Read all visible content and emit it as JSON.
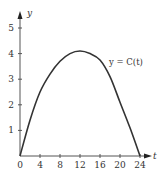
{
  "chart_data": {
    "type": "line",
    "title": "",
    "xlabel": "t",
    "ylabel": "y",
    "xlim": [
      0,
      24
    ],
    "ylim": [
      0,
      5
    ],
    "x_ticks": [
      0,
      4,
      8,
      12,
      16,
      20,
      24
    ],
    "y_ticks": [
      1,
      2,
      3,
      4,
      5
    ],
    "grid": false,
    "legend": "none",
    "annotations": [
      {
        "text": "y = C(t)",
        "x": 18,
        "y": 3.6
      }
    ],
    "series": [
      {
        "name": "y = C(t)",
        "x": [
          0,
          2,
          4,
          6,
          8,
          10,
          12,
          14,
          16,
          18,
          20,
          22,
          24
        ],
        "values": [
          0,
          1.4,
          2.5,
          3.2,
          3.7,
          4.0,
          4.1,
          4.0,
          3.75,
          3.1,
          2.1,
          1.1,
          0
        ]
      }
    ]
  },
  "labels": {
    "x_axis": "t",
    "y_axis": "y",
    "curve": "y = C(t)",
    "x_ticks": [
      "0",
      "4",
      "8",
      "12",
      "16",
      "20",
      "24"
    ],
    "y_ticks": [
      "1",
      "2",
      "3",
      "4",
      "5"
    ]
  },
  "colors": {
    "axis": "#555555",
    "curve": "#333333"
  }
}
